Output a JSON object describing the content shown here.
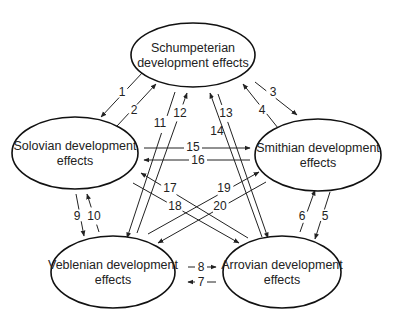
{
  "diagram": {
    "type": "development effects interaction diagram",
    "nodes": [
      {
        "id": "schumpeterian",
        "lines": [
          "Schumpeterian",
          "development effects"
        ],
        "cx": 193,
        "cy": 55,
        "rx": 62,
        "ry": 32
      },
      {
        "id": "solovian",
        "lines": [
          "Solovian development",
          "effects"
        ],
        "cx": 75,
        "cy": 153,
        "rx": 63,
        "ry": 36
      },
      {
        "id": "smithian",
        "lines": [
          "Smithian development",
          "effects"
        ],
        "cx": 318,
        "cy": 155,
        "rx": 63,
        "ry": 36
      },
      {
        "id": "veblenian",
        "lines": [
          "Veblenian development",
          "effects"
        ],
        "cx": 113,
        "cy": 272,
        "rx": 62,
        "ry": 36
      },
      {
        "id": "arrovian",
        "lines": [
          "Arrovian development",
          "effects"
        ],
        "cx": 282,
        "cy": 272,
        "rx": 59,
        "ry": 36
      }
    ],
    "edges": [
      {
        "label": "1",
        "from": "schumpeterian",
        "to": "solovian",
        "x1": 143,
        "y1": 72,
        "x2": 101,
        "y2": 117,
        "lx": 122,
        "ly": 92
      },
      {
        "label": "2",
        "from": "solovian",
        "to": "schumpeterian",
        "x1": 117,
        "y1": 126,
        "x2": 156,
        "y2": 84,
        "lx": 134,
        "ly": 110
      },
      {
        "label": "3",
        "from": "schumpeterian",
        "to": "smithian",
        "x1": 255,
        "y1": 82,
        "x2": 297,
        "y2": 115,
        "lx": 273,
        "ly": 92
      },
      {
        "label": "4",
        "from": "smithian",
        "to": "schumpeterian",
        "x1": 278,
        "y1": 128,
        "x2": 243,
        "y2": 84,
        "lx": 262,
        "ly": 110
      },
      {
        "label": "5",
        "from": "smithian",
        "to": "arrovian",
        "x1": 330,
        "y1": 192,
        "x2": 315,
        "y2": 239,
        "lx": 325,
        "ly": 216
      },
      {
        "label": "6",
        "from": "arrovian",
        "to": "smithian",
        "x1": 300,
        "y1": 232,
        "x2": 315,
        "y2": 190,
        "lx": 302,
        "ly": 216
      },
      {
        "label": "7",
        "from": "arrovian",
        "to": "veblenian",
        "x1": 216,
        "y1": 282,
        "x2": 188,
        "y2": 282,
        "lx": 201,
        "ly": 282
      },
      {
        "label": "8",
        "from": "veblenian",
        "to": "arrovian",
        "x1": 188,
        "y1": 267,
        "x2": 216,
        "y2": 267,
        "lx": 201,
        "ly": 267
      },
      {
        "label": "9",
        "from": "solovian",
        "to": "veblenian",
        "x1": 76,
        "y1": 194,
        "x2": 84,
        "y2": 236,
        "lx": 77,
        "ly": 216
      },
      {
        "label": "10",
        "from": "veblenian",
        "to": "solovian",
        "x1": 99,
        "y1": 232,
        "x2": 87,
        "y2": 194,
        "lx": 94,
        "ly": 216
      },
      {
        "label": "11",
        "from": "schumpeterian",
        "to": "veblenian",
        "x1": 175,
        "y1": 92,
        "x2": 127,
        "y2": 238,
        "lx": 160,
        "ly": 123
      },
      {
        "label": "12",
        "from": "veblenian",
        "to": "schumpeterian",
        "x1": 137,
        "y1": 233,
        "x2": 187,
        "y2": 93,
        "lx": 180,
        "ly": 113
      },
      {
        "label": "13",
        "from": "schumpeterian",
        "to": "arrovian",
        "x1": 218,
        "y1": 94,
        "x2": 268,
        "y2": 238,
        "lx": 226,
        "ly": 113
      },
      {
        "label": "14",
        "from": "arrovian",
        "to": "schumpeterian",
        "x1": 262,
        "y1": 237,
        "x2": 210,
        "y2": 93,
        "lx": 217,
        "ly": 131
      },
      {
        "label": "15",
        "from": "solovian",
        "to": "smithian",
        "x1": 144,
        "y1": 148,
        "x2": 250,
        "y2": 148,
        "lx": 193,
        "ly": 147
      },
      {
        "label": "16",
        "from": "smithian",
        "to": "solovian",
        "x1": 250,
        "y1": 160,
        "x2": 144,
        "y2": 160,
        "lx": 198,
        "ly": 160
      },
      {
        "label": "17",
        "from": "arrovian",
        "to": "solovian",
        "x1": 248,
        "y1": 238,
        "x2": 141,
        "y2": 173,
        "lx": 170,
        "ly": 188
      },
      {
        "label": "18",
        "from": "solovian",
        "to": "arrovian",
        "x1": 133,
        "y1": 183,
        "x2": 239,
        "y2": 243,
        "lx": 175,
        "ly": 206
      },
      {
        "label": "19",
        "from": "veblenian",
        "to": "smithian",
        "x1": 148,
        "y1": 234,
        "x2": 259,
        "y2": 172,
        "lx": 224,
        "ly": 188
      },
      {
        "label": "20",
        "from": "smithian",
        "to": "veblenian",
        "x1": 266,
        "y1": 182,
        "x2": 158,
        "y2": 243,
        "lx": 220,
        "ly": 206
      }
    ]
  },
  "colors": {
    "stroke": "#111111",
    "text": "#222222",
    "background": "#ffffff"
  }
}
